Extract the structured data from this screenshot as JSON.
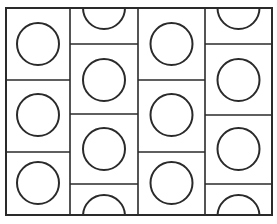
{
  "diagram": {
    "colors": {
      "background": "#ffffff",
      "stroke": "#2a2a2a"
    },
    "frame": {
      "x": 6,
      "y": 8,
      "width": 266,
      "height": 207
    },
    "columns": [
      {
        "x0": 6,
        "x1": 70,
        "dividers": [
          80,
          152
        ],
        "circles": [
          44,
          115,
          183
        ]
      },
      {
        "x0": 70,
        "x1": 138,
        "dividers": [
          44,
          114,
          184
        ],
        "circles": [
          8,
          80,
          149,
          216
        ]
      },
      {
        "x0": 138,
        "x1": 205,
        "dividers": [
          80,
          152
        ],
        "circles": [
          44,
          115,
          183
        ]
      },
      {
        "x0": 205,
        "x1": 272,
        "dividers": [
          44,
          115,
          184
        ],
        "circles": [
          8,
          80,
          149,
          216
        ]
      }
    ],
    "circle_radius": 21
  }
}
